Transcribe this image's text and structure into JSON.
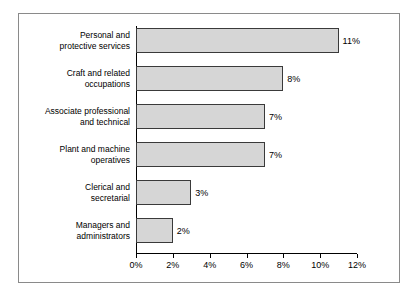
{
  "chart_data": {
    "type": "bar",
    "orientation": "horizontal",
    "title": "",
    "subtitle": "",
    "xlabel": "",
    "ylabel": "",
    "grid": false,
    "legend": false,
    "xlim": [
      0,
      12
    ],
    "xticks": [
      "0%",
      "2%",
      "4%",
      "6%",
      "8%",
      "10%",
      "12%"
    ],
    "xtick_values": [
      0,
      2,
      4,
      6,
      8,
      10,
      12
    ],
    "categories": [
      "Personal and\nprotective services",
      "Craft and related\noccupations",
      "Associate professional\nand technical",
      "Plant and machine\noperatives",
      "Clerical and\nsecretarial",
      "Managers and\nadministrators"
    ],
    "values": [
      11,
      8,
      7,
      7,
      3,
      2
    ],
    "data_labels": [
      "11%",
      "8%",
      "7%",
      "7%",
      "3%",
      "2%"
    ],
    "bars": [
      {
        "label_line1": "Personal and",
        "label_line2": "protective services",
        "value": 11,
        "data_label": "11%"
      },
      {
        "label_line1": "Craft and related",
        "label_line2": "occupations",
        "value": 8,
        "data_label": "8%"
      },
      {
        "label_line1": "Associate professional",
        "label_line2": "and technical",
        "value": 7,
        "data_label": "7%"
      },
      {
        "label_line1": "Plant and machine",
        "label_line2": "operatives",
        "value": 7,
        "data_label": "7%"
      },
      {
        "label_line1": "Clerical and",
        "label_line2": "secretarial",
        "value": 3,
        "data_label": "3%"
      },
      {
        "label_line1": "Managers and",
        "label_line2": "administrators",
        "value": 2,
        "data_label": "2%"
      }
    ],
    "colors": {
      "bar_fill": "#d6d6d6",
      "bar_stroke": "#3a3a3a",
      "axis": "#000000",
      "frame_border": "#8a8a8a",
      "background": "#ffffff",
      "text": "#000000"
    }
  }
}
